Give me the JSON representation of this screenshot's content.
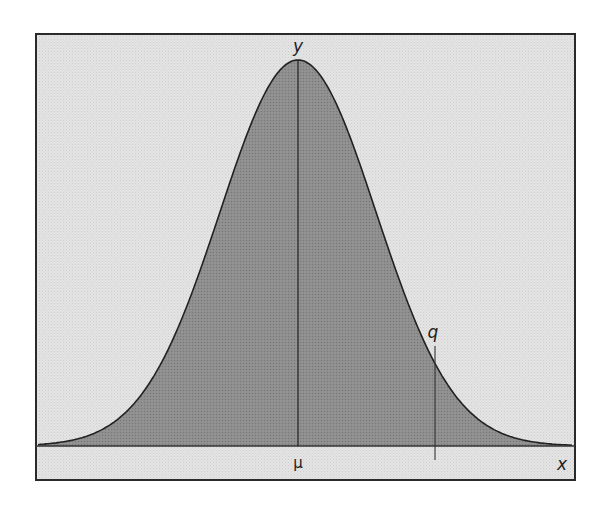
{
  "chart_data": {
    "type": "area",
    "title": "",
    "xlabel": "x",
    "ylabel": "y",
    "annotations": [
      {
        "label": "μ",
        "position": "mean, center of distribution, vertical line to peak"
      },
      {
        "label": "q",
        "position": "right tail quantile, vertical marker line"
      }
    ],
    "grid": false,
    "legend": null,
    "curve": {
      "distribution": "normal",
      "mean_label": "μ",
      "fill": "shaded"
    }
  },
  "labels": {
    "y_axis": "y",
    "x_axis": "x",
    "mu": "μ",
    "q": "q"
  },
  "colors": {
    "background": "#e6e6e6",
    "curve_fill": "#8c8c8c",
    "stroke": "#222222",
    "frame": "#333333"
  }
}
